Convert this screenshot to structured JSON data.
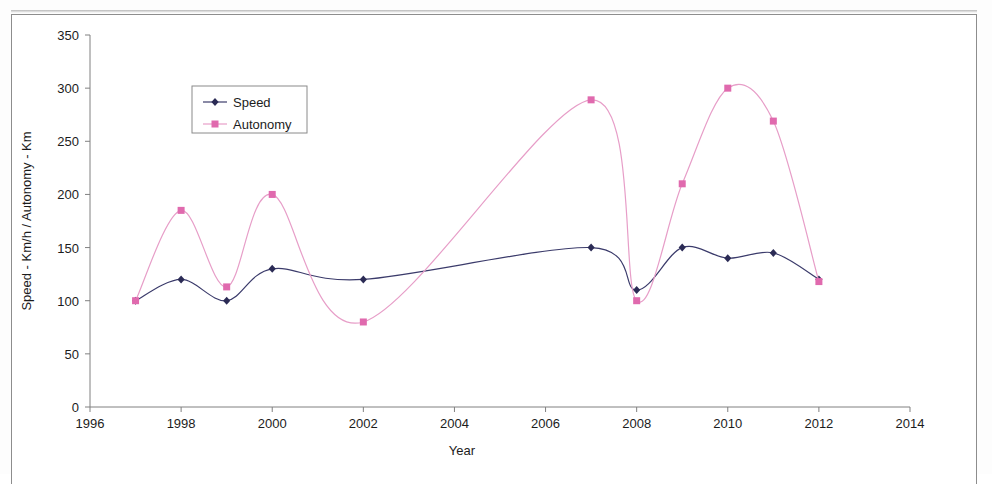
{
  "chart_data": {
    "type": "line",
    "title": "",
    "xlabel": "Year",
    "ylabel": "Speed - Km/h / Autonomy - Km",
    "xlim": [
      1996,
      2014
    ],
    "ylim": [
      0,
      350
    ],
    "xticks": [
      1996,
      1998,
      2000,
      2002,
      2004,
      2006,
      2008,
      2010,
      2012,
      2014
    ],
    "yticks": [
      0,
      50,
      100,
      150,
      200,
      250,
      300,
      350
    ],
    "xtick_labels": [
      "1996",
      "1998",
      "2000",
      "2002",
      "2004",
      "2006",
      "2008",
      "2010",
      "2012",
      "2014"
    ],
    "ytick_labels": [
      "0",
      "50",
      "100",
      "150",
      "200",
      "250",
      "300",
      "350"
    ],
    "grid": false,
    "legend_position": "upper-left-inside",
    "smoothing": "spline",
    "series": [
      {
        "name": "Speed",
        "color": "#3b3b6b",
        "marker": "diamond",
        "marker_color": "#2b2b55",
        "x": [
          1997,
          1998,
          1999,
          2000,
          2002,
          2007,
          2008,
          2009,
          2010,
          2011,
          2012
        ],
        "values": [
          100,
          120,
          100,
          130,
          120,
          150,
          110,
          150,
          140,
          145,
          120
        ]
      },
      {
        "name": "Autonomy",
        "color": "#e79ec8",
        "marker": "square",
        "marker_color": "#e06aae",
        "x": [
          1997,
          1998,
          1999,
          2000,
          2002,
          2007,
          2008,
          2009,
          2010,
          2011,
          2012
        ],
        "values": [
          100,
          185,
          113,
          200,
          80,
          289,
          100,
          210,
          300,
          269,
          118
        ]
      }
    ]
  },
  "legend": {
    "entries": [
      {
        "label": "Speed"
      },
      {
        "label": "Autonomy"
      }
    ]
  },
  "axes": {
    "x_title": "Year",
    "y_title": "Speed - Km/h / Autonomy - Km"
  }
}
